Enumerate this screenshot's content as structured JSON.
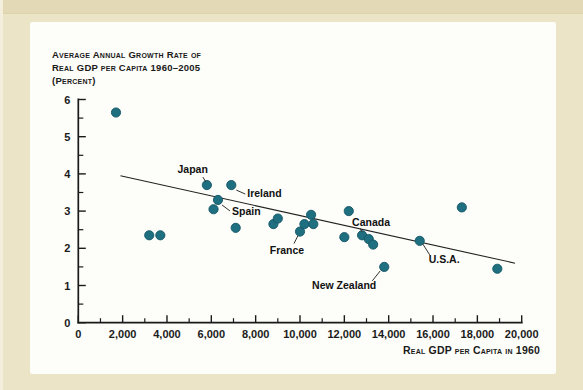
{
  "page": {
    "background_color": "#ece4c6",
    "panel_color": "#fdfdf9"
  },
  "chart_data": {
    "type": "scatter",
    "title_lines": [
      "Average Annual Growth Rate of",
      "Real GDP per Capita 1960–2005",
      "(Percent)"
    ],
    "xlabel": "Real GDP per Capita in 1960",
    "ylabel": "",
    "xlim": [
      0,
      20000
    ],
    "ylim": [
      0,
      6
    ],
    "grid": false,
    "dot_color": "#1e6f7f",
    "dot_edge_color": "#145666",
    "axis_color": "#1a1a1a",
    "x_major_ticks": [
      {
        "v": 0,
        "label": "0"
      },
      {
        "v": 2000,
        "label": "2,000"
      },
      {
        "v": 4000,
        "label": "4,000"
      },
      {
        "v": 6000,
        "label": "6,000"
      },
      {
        "v": 8000,
        "label": "8,000"
      },
      {
        "v": 10000,
        "label": "10,000"
      },
      {
        "v": 12000,
        "label": "12,000"
      },
      {
        "v": 14000,
        "label": "14,000"
      },
      {
        "v": 16000,
        "label": "16,000"
      },
      {
        "v": 18000,
        "label": "18,000"
      },
      {
        "v": 20000,
        "label": "20,000"
      }
    ],
    "x_minor_step": 1000,
    "y_major_ticks": [
      {
        "v": 0,
        "label": "0"
      },
      {
        "v": 1,
        "label": "1"
      },
      {
        "v": 2,
        "label": "2"
      },
      {
        "v": 3,
        "label": "3"
      },
      {
        "v": 4,
        "label": "4"
      },
      {
        "v": 5,
        "label": "5"
      },
      {
        "v": 6,
        "label": "6"
      }
    ],
    "y_minor_step": 0.5,
    "trend_line": {
      "x1": 1900,
      "y1": 3.95,
      "x2": 19700,
      "y2": 1.6
    },
    "points": [
      {
        "x": 1700,
        "y": 5.65
      },
      {
        "x": 3200,
        "y": 2.35
      },
      {
        "x": 3700,
        "y": 2.35
      },
      {
        "x": 5800,
        "y": 3.7,
        "label": "Japan"
      },
      {
        "x": 6100,
        "y": 3.05
      },
      {
        "x": 6300,
        "y": 3.3,
        "label": "Spain"
      },
      {
        "x": 6900,
        "y": 3.7,
        "label": "Ireland"
      },
      {
        "x": 7100,
        "y": 2.55
      },
      {
        "x": 8800,
        "y": 2.65
      },
      {
        "x": 9000,
        "y": 2.8
      },
      {
        "x": 10000,
        "y": 2.45,
        "label": "France"
      },
      {
        "x": 10200,
        "y": 2.65
      },
      {
        "x": 10500,
        "y": 2.9
      },
      {
        "x": 10600,
        "y": 2.65
      },
      {
        "x": 12000,
        "y": 2.3
      },
      {
        "x": 12200,
        "y": 3.0
      },
      {
        "x": 12800,
        "y": 2.35,
        "label": "Canada"
      },
      {
        "x": 13100,
        "y": 2.25
      },
      {
        "x": 13300,
        "y": 2.1
      },
      {
        "x": 13800,
        "y": 1.5,
        "label": "New Zealand"
      },
      {
        "x": 15400,
        "y": 2.2,
        "label": "U.S.A."
      },
      {
        "x": 17300,
        "y": 3.1
      },
      {
        "x": 18900,
        "y": 1.45
      }
    ],
    "annotations": [
      {
        "label": "Japan",
        "x": 5800,
        "y": 3.7,
        "anchor": "end",
        "tx": 1,
        "ty": -12,
        "leader": [
          -4,
          -8,
          -1,
          -3
        ]
      },
      {
        "label": "Ireland",
        "x": 6900,
        "y": 3.7,
        "anchor": "start",
        "tx": 16,
        "ty": 12,
        "leader": [
          5,
          5,
          14,
          9
        ]
      },
      {
        "label": "Spain",
        "x": 6300,
        "y": 3.3,
        "anchor": "start",
        "tx": 14,
        "ty": 15,
        "leader": [
          4,
          5,
          12,
          11
        ]
      },
      {
        "label": "France",
        "x": 10000,
        "y": 2.45,
        "anchor": "middle",
        "tx": -13,
        "ty": 22,
        "leader": [
          -2,
          4,
          -6,
          12
        ]
      },
      {
        "label": "Canada",
        "x": 12800,
        "y": 2.35,
        "anchor": "middle",
        "tx": 9,
        "ty": -9,
        "leader": [
          -2,
          -7,
          0,
          -3
        ]
      },
      {
        "label": "U.S.A.",
        "x": 15400,
        "y": 2.2,
        "anchor": "start",
        "tx": 9,
        "ty": 22,
        "leader": [
          3,
          3,
          10,
          14
        ]
      },
      {
        "label": "New Zealand",
        "x": 13800,
        "y": 1.5,
        "anchor": "end",
        "tx": -8,
        "ty": 22,
        "leader": [
          -12,
          14,
          -4,
          4
        ]
      }
    ]
  }
}
